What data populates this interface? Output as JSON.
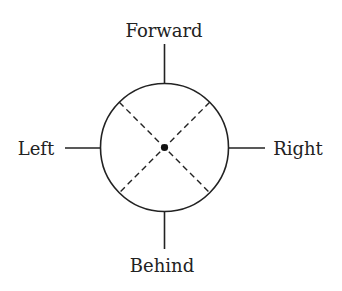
{
  "diagram": {
    "type": "direction-compass",
    "labels": {
      "top": "Forward",
      "left": "Left",
      "right": "Right",
      "bottom": "Behind"
    },
    "center": {
      "x": 164.5,
      "y": 147.5
    },
    "radius": 64,
    "center_dot": true,
    "diagonals": "dashed",
    "colors": {
      "stroke": "#222222",
      "background": "#ffffff"
    }
  }
}
